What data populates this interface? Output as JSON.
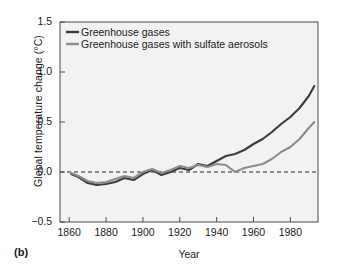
{
  "chart_data": {
    "type": "line",
    "title": "",
    "panel_label": "(b)",
    "xlabel": "Year",
    "ylabel": "Global temperature change (°C)",
    "xlim": [
      1855,
      1995
    ],
    "ylim": [
      -0.5,
      1.5
    ],
    "xticks": [
      1860,
      1880,
      1900,
      1920,
      1940,
      1960,
      1980
    ],
    "yticks": [
      -0.5,
      0.0,
      0.5,
      1.0,
      1.5
    ],
    "ytick_labels": [
      "−0.5",
      "0.0",
      "0.5",
      "1.0",
      "1.5"
    ],
    "grid": false,
    "legend_position": "top-left",
    "zero_reference_line": 0.0,
    "series": [
      {
        "name": "Greenhouse gases",
        "color": "#3c3c3c",
        "x": [
          1861,
          1865,
          1870,
          1875,
          1880,
          1885,
          1890,
          1895,
          1900,
          1905,
          1910,
          1915,
          1920,
          1925,
          1930,
          1935,
          1940,
          1945,
          1950,
          1955,
          1960,
          1965,
          1970,
          1975,
          1980,
          1985,
          1990,
          1993
        ],
        "values": [
          -0.02,
          -0.05,
          -0.11,
          -0.13,
          -0.12,
          -0.1,
          -0.06,
          -0.08,
          -0.02,
          0.02,
          -0.03,
          0.0,
          0.04,
          0.02,
          0.08,
          0.06,
          0.11,
          0.16,
          0.18,
          0.22,
          0.28,
          0.33,
          0.4,
          0.48,
          0.55,
          0.64,
          0.76,
          0.86
        ]
      },
      {
        "name": "Greenhouse gases with sulfate aerosols",
        "color": "#8c8c8c",
        "x": [
          1861,
          1865,
          1870,
          1875,
          1880,
          1885,
          1890,
          1895,
          1900,
          1905,
          1910,
          1915,
          1920,
          1925,
          1930,
          1935,
          1940,
          1945,
          1950,
          1955,
          1960,
          1965,
          1970,
          1975,
          1980,
          1985,
          1990,
          1993
        ],
        "values": [
          -0.01,
          -0.04,
          -0.09,
          -0.11,
          -0.1,
          -0.07,
          -0.04,
          -0.06,
          0.0,
          0.03,
          -0.01,
          0.02,
          0.06,
          0.04,
          0.07,
          0.05,
          0.08,
          0.07,
          0.0,
          0.04,
          0.06,
          0.08,
          0.13,
          0.2,
          0.25,
          0.33,
          0.44,
          0.5
        ]
      }
    ]
  }
}
